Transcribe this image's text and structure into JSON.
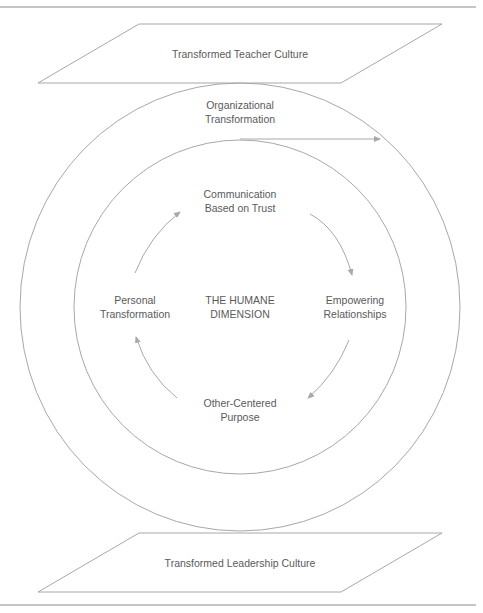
{
  "diagram": {
    "top_plane": {
      "label": "Transformed Teacher Culture"
    },
    "bottom_plane": {
      "label": "Transformed Leadership Culture"
    },
    "outer_ring": {
      "label": "Organizational\nTransformation"
    },
    "center": {
      "label": "THE HUMANE\nDIMENSION"
    },
    "cycle_nodes": [
      {
        "position": "top",
        "label": "Communication\nBased on Trust"
      },
      {
        "position": "right",
        "label": "Empowering\nRelationships"
      },
      {
        "position": "bottom",
        "label": "Other-Centered\nPurpose"
      },
      {
        "position": "left",
        "label": "Personal\nTransformation"
      }
    ],
    "colors": {
      "line": "#a8a8a8",
      "text": "#5a5a5a",
      "rule": "#8c8c8c"
    }
  }
}
